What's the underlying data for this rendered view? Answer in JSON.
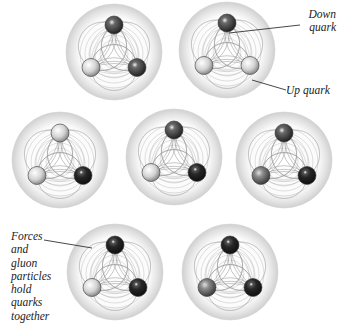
{
  "diagram": {
    "sphere_radius": 48,
    "quark_radius": 9,
    "colors": {
      "light": "#d8d8d8",
      "medium": "#7a7a7a",
      "dark": "#4a4a4a",
      "black": "#1e1e1e",
      "field_line": "#8a8a8a",
      "halo": "#e6e6e6"
    },
    "particles": [
      {
        "id": 1,
        "cx": 114,
        "cy": 52,
        "quarks": [
          "dark",
          "light",
          "dark"
        ]
      },
      {
        "id": 2,
        "cx": 227,
        "cy": 50,
        "quarks": [
          "dark",
          "light",
          "light"
        ]
      },
      {
        "id": 3,
        "cx": 60,
        "cy": 160,
        "quarks": [
          "light",
          "light",
          "black"
        ]
      },
      {
        "id": 4,
        "cx": 174,
        "cy": 157,
        "quarks": [
          "dark",
          "light",
          "black"
        ]
      },
      {
        "id": 5,
        "cx": 284,
        "cy": 160,
        "quarks": [
          "dark",
          "medium",
          "black"
        ]
      },
      {
        "id": 6,
        "cx": 115,
        "cy": 272,
        "quarks": [
          "black",
          "light",
          "black"
        ]
      },
      {
        "id": 7,
        "cx": 230,
        "cy": 272,
        "quarks": [
          "black",
          "medium",
          "black"
        ]
      }
    ],
    "labels": {
      "down_quark": [
        "Down",
        "quark"
      ],
      "up_quark": "Up quark",
      "forces": [
        "Forces",
        "and",
        "gluon",
        "particles",
        "hold",
        "quarks",
        "together"
      ]
    }
  }
}
